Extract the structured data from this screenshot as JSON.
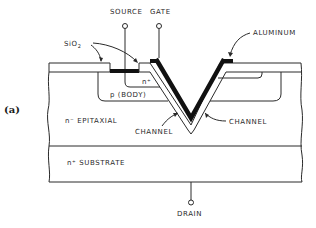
{
  "figure": {
    "panel_label": "(a)",
    "labels": {
      "source": "SOURCE",
      "gate": "GATE",
      "aluminum": "ALUMINUM",
      "sio2": "SiO",
      "sio2_sub": "2",
      "n_plus_source": "n⁺",
      "p_body": "p (BODY)",
      "n_epitaxial": "n⁻ EPITAXIAL",
      "channel_left": "CHANNEL",
      "channel_right": "CHANNEL",
      "n_substrate": "n⁺ SUBSTRATE",
      "drain": "DRAIN"
    },
    "layers": [
      {
        "name": "SiO2",
        "role": "oxide"
      },
      {
        "name": "n+",
        "role": "source region"
      },
      {
        "name": "p (BODY)",
        "role": "body region"
      },
      {
        "name": "n- EPITAXIAL",
        "role": "drift region"
      },
      {
        "name": "n+ SUBSTRATE",
        "role": "drain substrate"
      }
    ],
    "terminals": [
      "SOURCE",
      "GATE",
      "DRAIN"
    ],
    "colors": {
      "line": "#2a2a2a",
      "metal": "#111111",
      "background": "#ffffff"
    }
  }
}
